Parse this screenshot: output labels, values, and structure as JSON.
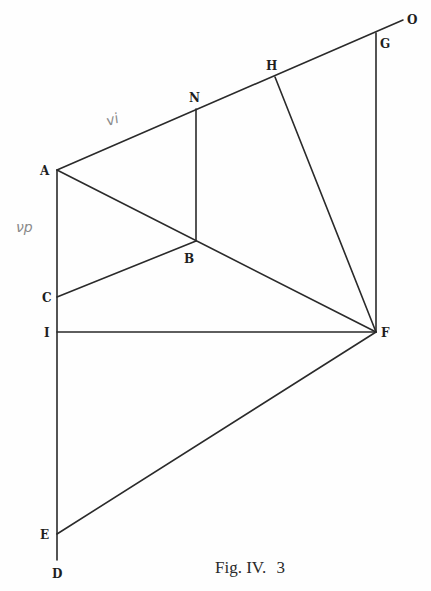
{
  "figure": {
    "caption_main": "Fig. IV.",
    "caption_num": "3"
  },
  "points": {
    "A": {
      "label": "A",
      "x": 57,
      "y": 170
    },
    "N": {
      "label": "N",
      "x": 196,
      "y": 109
    },
    "H": {
      "label": "H",
      "x": 275,
      "y": 77
    },
    "G": {
      "label": "G",
      "x": 376,
      "y": 33
    },
    "O": {
      "label": "O",
      "x": 403,
      "y": 20
    },
    "B": {
      "label": "B",
      "x": 196,
      "y": 241
    },
    "C": {
      "label": "C",
      "x": 57,
      "y": 297
    },
    "I": {
      "label": "I",
      "x": 57,
      "y": 332
    },
    "F": {
      "label": "F",
      "x": 376,
      "y": 332
    },
    "E": {
      "label": "E",
      "x": 57,
      "y": 534
    },
    "D": {
      "label": "D",
      "x": 57,
      "y": 560
    }
  },
  "segments": [
    [
      "A",
      "O"
    ],
    [
      "A",
      "D"
    ],
    [
      "A",
      "F"
    ],
    [
      "N",
      "B"
    ],
    [
      "C",
      "B"
    ],
    [
      "H",
      "F"
    ],
    [
      "G",
      "F"
    ],
    [
      "I",
      "F"
    ],
    [
      "E",
      "F"
    ]
  ],
  "annotations": {
    "vi": "vi",
    "vp": "νp"
  }
}
